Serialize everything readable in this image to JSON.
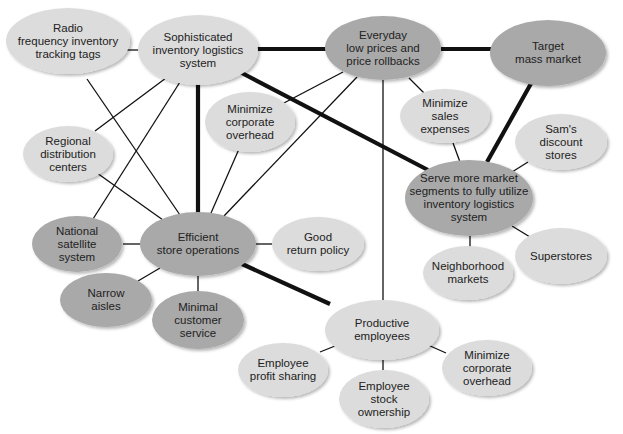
{
  "diagram": {
    "colors": {
      "light_node": "#dcdcdc",
      "dark_node": "#a9a9a9",
      "edge": "#111111",
      "background": "#ffffff"
    },
    "nodes": [
      {
        "id": "rfid",
        "label": "Radio\nfrequency inventory\ntracking tags",
        "cx": 68,
        "cy": 41,
        "rx": 62,
        "ry": 33,
        "shade": "light"
      },
      {
        "id": "logistics",
        "label": "Sophisticated\ninventory logistics\nsystem",
        "cx": 198,
        "cy": 50,
        "rx": 60,
        "ry": 35,
        "shade": "light"
      },
      {
        "id": "edlp",
        "label": "Everyday\nlow prices and\nprice rollbacks",
        "cx": 383,
        "cy": 48,
        "rx": 58,
        "ry": 32,
        "shade": "dark"
      },
      {
        "id": "target",
        "label": "Target\nmass market",
        "cx": 548,
        "cy": 53,
        "rx": 58,
        "ry": 33,
        "shade": "dark"
      },
      {
        "id": "corp_overhead_top",
        "label": "Minimize\ncorporate\noverhead",
        "cx": 250,
        "cy": 122,
        "rx": 45,
        "ry": 30,
        "shade": "light"
      },
      {
        "id": "sales_expenses",
        "label": "Minimize\nsales\nexpenses",
        "cx": 445,
        "cy": 116,
        "rx": 45,
        "ry": 27,
        "shade": "light"
      },
      {
        "id": "regional",
        "label": "Regional\ndistribution\ncenters",
        "cx": 68,
        "cy": 154,
        "rx": 45,
        "ry": 28,
        "shade": "light"
      },
      {
        "id": "sams",
        "label": "Sam's\ndiscount\nstores",
        "cx": 561,
        "cy": 142,
        "rx": 46,
        "ry": 28,
        "shade": "light"
      },
      {
        "id": "segments",
        "label": "Serve more market\nsegments to fully utilize\ninventory logistics\nsystem",
        "cx": 469,
        "cy": 198,
        "rx": 64,
        "ry": 38,
        "shade": "dark"
      },
      {
        "id": "satellite",
        "label": "National\nsatellite\nsystem",
        "cx": 77,
        "cy": 244,
        "rx": 45,
        "ry": 28,
        "shade": "dark"
      },
      {
        "id": "efficient",
        "label": "Efficient\nstore operations",
        "cx": 198,
        "cy": 244,
        "rx": 58,
        "ry": 32,
        "shade": "dark"
      },
      {
        "id": "return_policy",
        "label": "Good\nreturn policy",
        "cx": 318,
        "cy": 244,
        "rx": 46,
        "ry": 27,
        "shade": "light"
      },
      {
        "id": "superstores",
        "label": "Superstores",
        "cx": 561,
        "cy": 256,
        "rx": 46,
        "ry": 28,
        "shade": "light"
      },
      {
        "id": "neighborhood",
        "label": "Neighborhood\nmarkets",
        "cx": 468,
        "cy": 273,
        "rx": 45,
        "ry": 27,
        "shade": "light"
      },
      {
        "id": "narrow",
        "label": "Narrow\naisles",
        "cx": 106,
        "cy": 300,
        "rx": 46,
        "ry": 27,
        "shade": "dark"
      },
      {
        "id": "minimal_service",
        "label": "Minimal\ncustomer\nservice",
        "cx": 198,
        "cy": 320,
        "rx": 46,
        "ry": 29,
        "shade": "dark"
      },
      {
        "id": "productive",
        "label": "Productive\nemployees",
        "cx": 382,
        "cy": 330,
        "rx": 57,
        "ry": 30,
        "shade": "light"
      },
      {
        "id": "profit_sharing",
        "label": "Employee\nprofit sharing",
        "cx": 283,
        "cy": 370,
        "rx": 45,
        "ry": 27,
        "shade": "light"
      },
      {
        "id": "corp_overhead_bottom",
        "label": "Minimize\ncorporate\noverhead",
        "cx": 487,
        "cy": 368,
        "rx": 45,
        "ry": 28,
        "shade": "light"
      },
      {
        "id": "stock_ownership",
        "label": "Employee\nstock\nownership",
        "cx": 384,
        "cy": 399,
        "rx": 45,
        "ry": 29,
        "shade": "light"
      }
    ],
    "edges": [
      {
        "from": "rfid",
        "to": "logistics",
        "weight": "thin",
        "x1": 126,
        "y1": 50,
        "x2": 140,
        "y2": 50
      },
      {
        "from": "logistics",
        "to": "edlp",
        "weight": "thick",
        "x1": 256,
        "y1": 49,
        "x2": 326,
        "y2": 49
      },
      {
        "from": "edlp",
        "to": "target",
        "weight": "thick",
        "x1": 441,
        "y1": 49,
        "x2": 491,
        "y2": 49
      },
      {
        "from": "logistics",
        "to": "segments",
        "weight": "thick",
        "x1": 240,
        "y1": 72,
        "x2": 428,
        "y2": 170
      },
      {
        "from": "target",
        "to": "segments",
        "weight": "thick",
        "x1": 533,
        "y1": 80,
        "x2": 487,
        "y2": 162
      },
      {
        "from": "logistics",
        "to": "efficient",
        "weight": "thick",
        "x1": 198,
        "y1": 81,
        "x2": 198,
        "y2": 213
      },
      {
        "from": "efficient",
        "to": "productive",
        "weight": "thick",
        "x1": 242,
        "y1": 264,
        "x2": 330,
        "y2": 304
      },
      {
        "from": "rfid",
        "to": "efficient",
        "weight": "thin",
        "x1": 87,
        "y1": 79,
        "x2": 180,
        "y2": 215
      },
      {
        "from": "logistics",
        "to": "regional",
        "weight": "thin",
        "x1": 166,
        "y1": 78,
        "x2": 95,
        "y2": 131
      },
      {
        "from": "logistics",
        "to": "satellite",
        "weight": "thin",
        "x1": 180,
        "y1": 82,
        "x2": 93,
        "y2": 219
      },
      {
        "from": "regional",
        "to": "efficient",
        "weight": "thin",
        "x1": 97,
        "y1": 173,
        "x2": 163,
        "y2": 220
      },
      {
        "from": "satellite",
        "to": "efficient",
        "weight": "thin",
        "x1": 123,
        "y1": 244,
        "x2": 140,
        "y2": 244
      },
      {
        "from": "edlp",
        "to": "corp_overhead_top",
        "weight": "thin",
        "x1": 343,
        "y1": 72,
        "x2": 282,
        "y2": 104
      },
      {
        "from": "edlp",
        "to": "efficient",
        "weight": "thin",
        "x1": 357,
        "y1": 77,
        "x2": 224,
        "y2": 216
      },
      {
        "from": "corp_overhead_top",
        "to": "efficient",
        "weight": "thin",
        "x1": 239,
        "y1": 149,
        "x2": 211,
        "y2": 213
      },
      {
        "from": "edlp",
        "to": "sales_expenses",
        "weight": "thin",
        "x1": 409,
        "y1": 78,
        "x2": 424,
        "y2": 93
      },
      {
        "from": "edlp",
        "to": "productive",
        "weight": "thin",
        "x1": 383,
        "y1": 80,
        "x2": 383,
        "y2": 300
      },
      {
        "from": "sales_expenses",
        "to": "segments",
        "weight": "thin",
        "x1": 453,
        "y1": 143,
        "x2": 460,
        "y2": 162
      },
      {
        "from": "sams",
        "to": "segments",
        "weight": "thin",
        "x1": 528,
        "y1": 162,
        "x2": 512,
        "y2": 172
      },
      {
        "from": "segments",
        "to": "superstores",
        "weight": "thin",
        "x1": 512,
        "y1": 226,
        "x2": 530,
        "y2": 237
      },
      {
        "from": "segments",
        "to": "neighborhood",
        "weight": "thin",
        "x1": 470,
        "y1": 236,
        "x2": 470,
        "y2": 247
      },
      {
        "from": "efficient",
        "to": "return_policy",
        "weight": "thin",
        "x1": 256,
        "y1": 244,
        "x2": 272,
        "y2": 244
      },
      {
        "from": "efficient",
        "to": "narrow",
        "weight": "thin",
        "x1": 160,
        "y1": 268,
        "x2": 138,
        "y2": 281
      },
      {
        "from": "efficient",
        "to": "minimal_service",
        "weight": "thin",
        "x1": 198,
        "y1": 276,
        "x2": 198,
        "y2": 291
      },
      {
        "from": "productive",
        "to": "profit_sharing",
        "weight": "thin",
        "x1": 340,
        "y1": 344,
        "x2": 320,
        "y2": 352
      },
      {
        "from": "productive",
        "to": "stock_ownership",
        "weight": "thin",
        "x1": 383,
        "y1": 360,
        "x2": 383,
        "y2": 370
      },
      {
        "from": "productive",
        "to": "corp_overhead_bottom",
        "weight": "thin",
        "x1": 428,
        "y1": 345,
        "x2": 446,
        "y2": 353
      }
    ]
  }
}
